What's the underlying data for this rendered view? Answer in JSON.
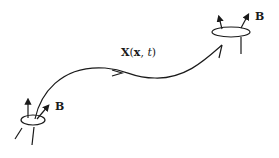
{
  "diagram": {
    "curve_label": {
      "bold_part": "X",
      "rest": "(x, t)",
      "x_bold": "x",
      "t_italic": "t"
    },
    "field_label_start": "B",
    "field_label_end": "B",
    "stroke_color": "#1a1a1a",
    "background": "#ffffff"
  }
}
